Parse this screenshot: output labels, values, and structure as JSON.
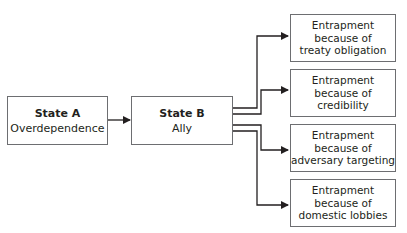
{
  "diagram": {
    "source": {
      "title": "State A",
      "subtitle": "Overdependence"
    },
    "target": {
      "title": "State B",
      "subtitle": "Ally"
    },
    "outcomes": [
      {
        "line1": "Entrapment",
        "line2": "because of",
        "line3": "treaty obligation"
      },
      {
        "line1": "Entrapment",
        "line2": "because of",
        "line3": "credibility"
      },
      {
        "line1": "Entrapment",
        "line2": "because of",
        "line3": "adversary targeting"
      },
      {
        "line1": "Entrapment",
        "line2": "because of",
        "line3": "domestic lobbies"
      }
    ],
    "colors": {
      "border": "#6d6e71",
      "line": "#231f20",
      "text": "#231f20"
    }
  }
}
